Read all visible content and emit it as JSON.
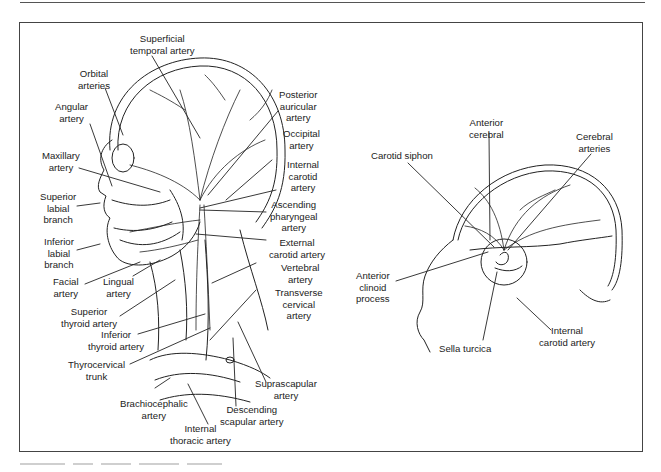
{
  "figure": {
    "panels": [
      {
        "id": "head-neck",
        "description": "Lateral view of head and neck arteries",
        "labels": {
          "superficial_temporal": "Superficial\ntemporal artery",
          "orbital": "Orbital\narteries",
          "angular": "Angular\nartery",
          "maxillary": "Maxillary\nartery",
          "superior_labial": "Superior\nlabial\nbranch",
          "inferior_labial": "Inferior\nlabial\nbranch",
          "facial": "Facial\nartery",
          "lingual": "Lingual\nartery",
          "superior_thyroid": "Superior\nthyroid artery",
          "inferior_thyroid": "Inferior\nthyroid artery",
          "thyrocervical": "Thyrocervical\ntrunk",
          "brachiocephalic": "Brachiocephalic\nartery",
          "internal_thoracic": "Internal\nthoracic artery",
          "descending_scapular": "Descending\nscapular artery",
          "suprascapular": "Suprascapular\nartery",
          "transverse_cervical": "Transverse\ncervical\nartery",
          "vertebral": "Vertebral\nartery",
          "external_carotid": "External\ncarotid artery",
          "ascending_pharyngeal": "Ascending\npharyngeal\nartery",
          "internal_carotid": "Internal\ncarotid\nartery",
          "occipital": "Occipital\nartery",
          "posterior_auricular": "Posterior\nauricular\nartery"
        }
      },
      {
        "id": "brain-sagittal",
        "description": "Sagittal view of carotid siphon and cerebral arteries",
        "labels": {
          "anterior_cerebral": "Anterior\ncerebral",
          "cerebral_arteries": "Cerebral\narteries",
          "carotid_siphon": "Carotid siphon",
          "anterior_clinoid": "Anterior\nclinoid\nprocess",
          "sella_turcica": "Sella turcica",
          "internal_carotid": "Internal\ncarotid artery"
        }
      }
    ]
  },
  "colors": {
    "ink": "#1a1a1a",
    "frame": "#444444",
    "background": "#ffffff"
  }
}
